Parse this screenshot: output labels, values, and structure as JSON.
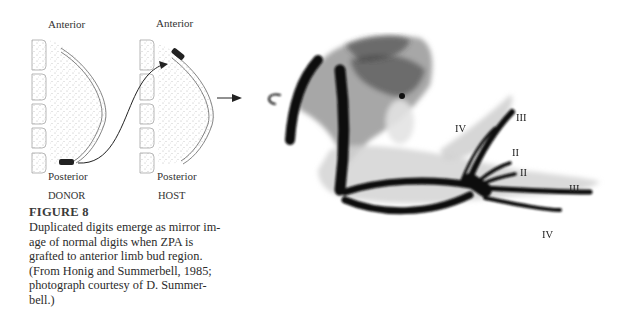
{
  "figure": {
    "number_label": "FIGURE 8",
    "caption_lines": [
      "Duplicated digits emerge as mirror im-",
      "age of normal digits when ZPA is",
      "grafted to anterior limb bud region.",
      "(From Honig and Summerbell, 1985;",
      "photograph courtesy of D. Summer-",
      "bell.)"
    ]
  },
  "diagram": {
    "donor": {
      "top_label": "Anterior",
      "bottom_label": "Posterior",
      "name_label": "DONOR"
    },
    "host": {
      "top_label": "Anterior",
      "bottom_label": "Posterior",
      "name_label": "HOST"
    }
  },
  "photograph": {
    "digit_labels": {
      "upper_iv": "IV",
      "upper_iii": "III",
      "upper_ii": "II",
      "lower_ii": "II",
      "lower_iii": "III",
      "lower_iv": "IV"
    }
  }
}
